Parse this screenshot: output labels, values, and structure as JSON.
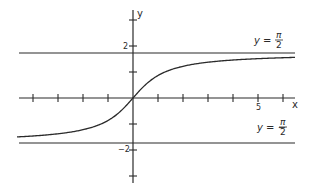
{
  "chart_data": {
    "type": "line",
    "title": "",
    "function": "y = arctan(x)",
    "xlabel": "x",
    "ylabel": "y",
    "x_range": [
      -5,
      6.5
    ],
    "y_range": [
      -3.3,
      3.4
    ],
    "grid": false,
    "legend": null,
    "x_ticks": [
      -4,
      -3,
      -2,
      -1,
      1,
      2,
      3,
      4,
      5,
      6
    ],
    "x_tick_labels": [
      {
        "value": 5,
        "label": "5"
      }
    ],
    "y_ticks": [
      -3,
      -2,
      -1,
      1,
      2,
      3
    ],
    "y_tick_labels": [
      {
        "value": 2,
        "label": "2"
      },
      {
        "value": -2,
        "label": "−2"
      }
    ],
    "asymptotes": [
      {
        "y": 1.5708,
        "label_lhs": "y =",
        "label_num": "π",
        "label_den": "2",
        "sign": ""
      },
      {
        "y": -1.5708,
        "label_lhs": "y =",
        "label_num": "π",
        "label_den": "2",
        "sign": "−"
      }
    ],
    "series": [
      {
        "name": "arctan(x)",
        "x": [
          -4.6,
          -4,
          -3,
          -2,
          -1,
          -0.5,
          0,
          0.5,
          1,
          2,
          3,
          4,
          5,
          6.5
        ],
        "y": [
          -1.357,
          -1.326,
          -1.249,
          -1.107,
          -0.785,
          -0.464,
          0,
          0.464,
          0.785,
          1.107,
          1.249,
          1.326,
          1.373,
          1.418
        ]
      }
    ],
    "colors": {
      "line": "#2a2a2a",
      "background": "#ffffff"
    }
  },
  "labels": {
    "x_axis": "x",
    "y_axis": "y",
    "tick_two": "2",
    "tick_neg_two": "−2",
    "tick_five": "5",
    "upper_asymptote": {
      "lhs": "y =",
      "num": "π",
      "den": "2"
    },
    "lower_asymptote": {
      "lhs": "y = −",
      "num": "π",
      "den": "2"
    }
  }
}
